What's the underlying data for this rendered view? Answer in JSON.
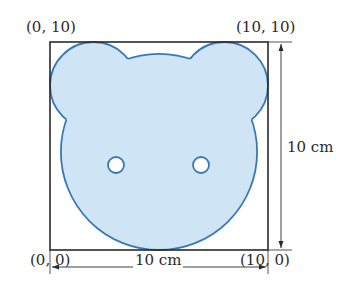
{
  "figure": {
    "square": {
      "side_label": "10 cm",
      "corners": {
        "top_left": "(0, 10)",
        "top_right": "(10, 10)",
        "bottom_left": "(0, 0)",
        "bottom_right": "(10, 0)"
      }
    },
    "dimensions": {
      "horizontal": "10 cm",
      "vertical": "10 cm"
    },
    "shapes": {
      "left_ear": {
        "cx": 2,
        "cy": 8,
        "r": 2
      },
      "right_ear": {
        "cx": 8,
        "cy": 8,
        "r": 2
      },
      "head": {
        "cx": 5,
        "cy": 4.5,
        "r": 4.5
      },
      "left_eye": {
        "cx": 3,
        "cy": 4,
        "r": 0.4
      },
      "right_eye": {
        "cx": 7,
        "cy": 4,
        "r": 0.4
      }
    },
    "colors": {
      "fill": "#cfe5f5",
      "stroke": "#3a78b5",
      "frame": "#2a2a2a",
      "text": "#2b2b2b"
    }
  }
}
